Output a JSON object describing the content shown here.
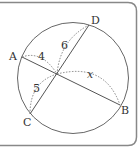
{
  "figure": {
    "type": "intersecting-chords-diagram",
    "points": {
      "A": "A",
      "B": "B",
      "C": "C",
      "D": "D"
    },
    "chords": [
      "AB",
      "CD"
    ],
    "segment_labels": {
      "PA": "4",
      "PD": "6",
      "PC": "5",
      "PB": "x"
    },
    "colors": {
      "stroke": "#555555",
      "frame": "#888888",
      "text": "#333333"
    }
  }
}
